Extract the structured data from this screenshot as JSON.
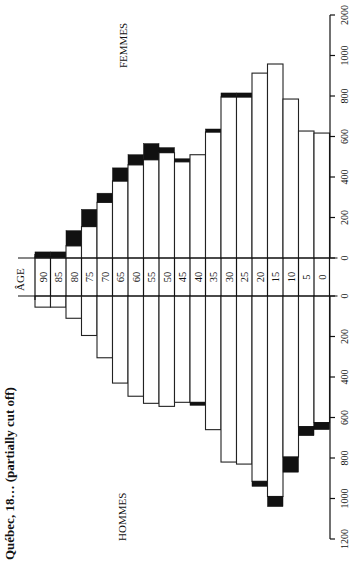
{
  "chart_data": {
    "type": "bar",
    "subtype": "population-pyramid",
    "orientation": "rotated-90",
    "title": "Québec, 18… (partially cut off)",
    "age_axis_label": "ÂGE",
    "categories": [
      "90",
      "85",
      "80",
      "75",
      "70",
      "65",
      "60",
      "55",
      "50",
      "45",
      "40",
      "35",
      "30",
      "25",
      "20",
      "15",
      "10",
      "5",
      "0"
    ],
    "series": [
      {
        "name": "FEMMES",
        "base_values": [
          5,
          5,
          60,
          155,
          275,
          380,
          460,
          485,
          520,
          475,
          510,
          622,
          795,
          795,
          913,
          958,
          785,
          627,
          617
        ],
        "total_values": [
          30,
          30,
          135,
          240,
          320,
          445,
          510,
          565,
          545,
          490,
          510,
          637,
          815,
          815,
          913,
          958,
          785,
          627,
          617
        ]
      },
      {
        "name": "HOMMES",
        "base_values": [
          55,
          55,
          110,
          195,
          305,
          430,
          495,
          530,
          545,
          525,
          525,
          660,
          820,
          830,
          915,
          990,
          795,
          645,
          625
        ],
        "total_values": [
          55,
          55,
          110,
          195,
          305,
          430,
          495,
          530,
          545,
          525,
          540,
          660,
          820,
          830,
          940,
          1040,
          870,
          690,
          660
        ]
      }
    ],
    "legend": {
      "white": "base population",
      "black": "excess over opposite sex"
    },
    "femmes_axis": {
      "ticks": [
        0,
        200,
        400,
        600,
        800,
        1000,
        2000
      ],
      "tick_labels": [
        "0",
        "200",
        "400",
        "600",
        "800",
        "1000",
        "2000"
      ],
      "range": [
        0,
        1200
      ]
    },
    "hommes_axis": {
      "ticks": [
        0,
        200,
        400,
        600,
        800,
        1000,
        1200
      ],
      "tick_labels": [
        "0",
        "200",
        "400",
        "600",
        "800",
        "1000",
        "1200"
      ],
      "range": [
        0,
        1200
      ]
    },
    "grid": false,
    "labels": {
      "femmes": "FEMMES",
      "hommes": "HOMMES"
    }
  }
}
